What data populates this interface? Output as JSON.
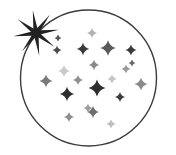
{
  "illustration": {
    "title": "Night sky starfield inside circle with bright star",
    "canvas": {
      "width": 176,
      "height": 155,
      "background": "#ffffff"
    },
    "circle": {
      "label": "sky-circle-outline",
      "cx": 88.5,
      "cy": 78,
      "r": 68,
      "stroke": "#3c3c3c",
      "stroke_width": 1.4,
      "fill": "none"
    },
    "bright_star": {
      "label": "bright-burst-star",
      "cx": 36,
      "cy": 33,
      "points": 8,
      "outer_radius": 23,
      "inner_radius": 5.2,
      "rotation": -8,
      "color": "#222222"
    },
    "colors": {
      "outline": "#3c3c3c",
      "star_dark": "#2b2b2b",
      "star_mid": "#6e6e6e",
      "star_light": "#a9a9a9",
      "star_faint": "#cfcfcf",
      "background": "#ffffff"
    },
    "star_count": 21,
    "stars": [
      {
        "name": "star-1",
        "cx": 92,
        "cy": 33,
        "r": 5.0,
        "ir": 1.1,
        "color": "#b3b3b3"
      },
      {
        "name": "star-2",
        "cx": 57,
        "cy": 50,
        "r": 4.6,
        "ir": 1.0,
        "color": "#4a4a4a"
      },
      {
        "name": "star-3",
        "cx": 83,
        "cy": 49,
        "r": 6.2,
        "ir": 1.3,
        "color": "#3a3a3a"
      },
      {
        "name": "star-4",
        "cx": 108,
        "cy": 48,
        "r": 7.8,
        "ir": 1.7,
        "color": "#5a5a5a"
      },
      {
        "name": "star-5",
        "cx": 131,
        "cy": 50,
        "r": 5.6,
        "ir": 1.2,
        "color": "#3a3a3a"
      },
      {
        "name": "star-6",
        "cx": 94,
        "cy": 65,
        "r": 5.2,
        "ir": 1.1,
        "color": "#8a8a8a"
      },
      {
        "name": "star-7",
        "cx": 126,
        "cy": 69,
        "r": 4.2,
        "ir": 0.9,
        "color": "#9a9a9a"
      },
      {
        "name": "star-8",
        "cx": 64,
        "cy": 71,
        "r": 6.0,
        "ir": 1.3,
        "color": "#cacaca"
      },
      {
        "name": "star-9",
        "cx": 46,
        "cy": 81,
        "r": 6.4,
        "ir": 1.4,
        "color": "#7a7a7a"
      },
      {
        "name": "star-10",
        "cx": 78,
        "cy": 80,
        "r": 5.0,
        "ir": 1.1,
        "color": "#8e8e8e"
      },
      {
        "name": "star-11",
        "cx": 97,
        "cy": 88,
        "r": 8.4,
        "ir": 1.8,
        "color": "#2e2e2e"
      },
      {
        "name": "star-12",
        "cx": 112,
        "cy": 79,
        "r": 4.4,
        "ir": 1.0,
        "color": "#c4c4c4"
      },
      {
        "name": "star-13",
        "cx": 141,
        "cy": 84,
        "r": 6.6,
        "ir": 1.4,
        "color": "#8a8a8a"
      },
      {
        "name": "star-14",
        "cx": 67,
        "cy": 94,
        "r": 7.2,
        "ir": 1.5,
        "color": "#2f2f2f"
      },
      {
        "name": "star-15",
        "cx": 120,
        "cy": 97,
        "r": 5.0,
        "ir": 1.1,
        "color": "#3d3d3d"
      },
      {
        "name": "star-16",
        "cx": 88,
        "cy": 108,
        "r": 4.6,
        "ir": 1.0,
        "color": "#9e9e9e"
      },
      {
        "name": "star-17",
        "cx": 93,
        "cy": 112,
        "r": 6.0,
        "ir": 1.3,
        "color": "#6e6e6e"
      },
      {
        "name": "star-18",
        "cx": 69,
        "cy": 117,
        "r": 5.0,
        "ir": 1.1,
        "color": "#8e8e8e"
      },
      {
        "name": "star-19",
        "cx": 111,
        "cy": 124,
        "r": 4.4,
        "ir": 1.0,
        "color": "#c0c0c0"
      },
      {
        "name": "star-20",
        "cx": 58,
        "cy": 38,
        "r": 3.4,
        "ir": 0.8,
        "color": "#555555"
      },
      {
        "name": "star-21",
        "cx": 132,
        "cy": 63,
        "r": 3.4,
        "ir": 0.8,
        "color": "#6a6a6a"
      }
    ]
  }
}
